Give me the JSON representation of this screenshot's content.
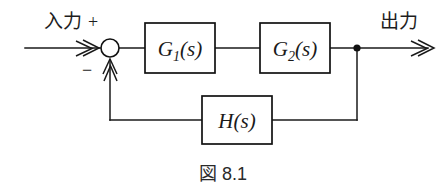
{
  "figure": {
    "caption": "図 8.1",
    "background_color": "#ffffff",
    "line_color": "#1a1a1a"
  },
  "signals": {
    "input_label": "入力",
    "output_label": "出力",
    "plus_sign": "+",
    "minus_sign": "−"
  },
  "blocks": [
    {
      "id": "g1",
      "label_main": "G",
      "label_sub": "1",
      "label_arg": "(s)",
      "full": "G1(s)"
    },
    {
      "id": "g2",
      "label_main": "G",
      "label_sub": "2",
      "label_arg": "(s)",
      "full": "G2(s)"
    },
    {
      "id": "h",
      "label_main": "H",
      "label_sub": "",
      "label_arg": "(s)",
      "full": "H(s)"
    }
  ],
  "icons": {
    "summing_junction": "summing-junction-icon",
    "takeoff_node": "takeoff-node-icon",
    "input_arrow": "arrowhead-right-icon",
    "output_arrow": "arrowhead-right-icon",
    "feedback_arrow": "arrowhead-up-icon"
  }
}
